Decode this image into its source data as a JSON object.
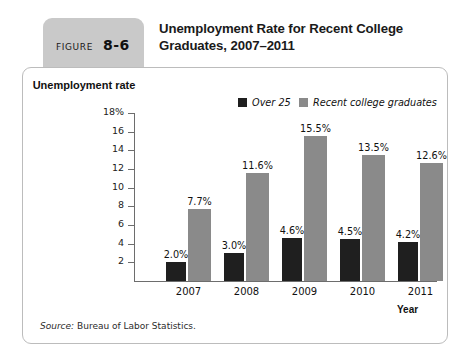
{
  "figure": {
    "label": "FIGURE",
    "number": "8-6",
    "title": "Unemployment Rate for Recent College Graduates, 2007–2011"
  },
  "source": {
    "prefix": "Source:",
    "text": "Bureau of Labor Statistics."
  },
  "chart_data": {
    "type": "bar",
    "title": "Unemployment Rate for Recent College Graduates, 2007–2011",
    "categories": [
      "2007",
      "2008",
      "2009",
      "2010",
      "2011"
    ],
    "series": [
      {
        "name": "Over 25",
        "color": "#1f1f1f",
        "values": [
          2.0,
          3.0,
          4.6,
          4.5,
          4.2
        ],
        "labels": [
          "2.0%",
          "3.0%",
          "4.6%",
          "4.5%",
          "4.2%"
        ]
      },
      {
        "name": "Recent college graduates",
        "color": "#8a8a8a",
        "values": [
          7.7,
          11.6,
          15.5,
          13.5,
          12.6
        ],
        "labels": [
          "7.7%",
          "11.6%",
          "15.5%",
          "13.5%",
          "12.6%"
        ]
      }
    ],
    "xlabel": "Year",
    "ylabel": "Unemployment rate",
    "ylim": [
      0,
      18
    ],
    "yticks": [
      2,
      4,
      6,
      8,
      10,
      12,
      14,
      16,
      18
    ],
    "ytick_labels": [
      "2",
      "4",
      "6",
      "8",
      "10",
      "12",
      "14",
      "16",
      "18%"
    ],
    "grid": false,
    "legend_position": "top-center"
  }
}
